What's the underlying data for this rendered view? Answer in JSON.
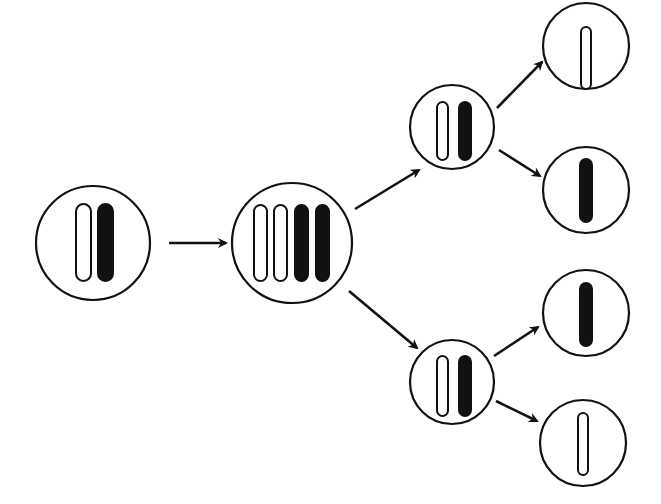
{
  "diagram": {
    "title": "",
    "colors": {
      "stroke": "#111111",
      "fill_dark": "#111111",
      "fill_light": "#ffffff",
      "background": "#ffffff"
    },
    "cells": [
      {
        "id": "parent-cell",
        "cx": 93,
        "cy": 243,
        "r": 57,
        "chromosomes": [
          "open",
          "filled"
        ]
      },
      {
        "id": "replicated-cell",
        "cx": 292,
        "cy": 243,
        "r": 60,
        "chromosomes": [
          "open",
          "open",
          "filled",
          "filled"
        ]
      },
      {
        "id": "daughter-cell-top",
        "cx": 452,
        "cy": 127,
        "r": 42,
        "chromosomes": [
          "open",
          "filled"
        ]
      },
      {
        "id": "daughter-cell-bottom",
        "cx": 452,
        "cy": 382,
        "r": 42,
        "chromosomes": [
          "open",
          "filled"
        ]
      },
      {
        "id": "gamete-1",
        "cx": 586,
        "cy": 46,
        "r": 43,
        "chromosomes": [
          "open"
        ]
      },
      {
        "id": "gamete-2",
        "cx": 586,
        "cy": 190,
        "r": 43,
        "chromosomes": [
          "filled"
        ]
      },
      {
        "id": "gamete-3",
        "cx": 586,
        "cy": 313,
        "r": 43,
        "chromosomes": [
          "filled"
        ]
      },
      {
        "id": "gamete-4",
        "cx": 583,
        "cy": 443,
        "r": 43,
        "chromosomes": [
          "open"
        ]
      }
    ],
    "arrows": [
      {
        "id": "arrow-parent-to-replicated",
        "from": "parent-cell",
        "to": "replicated-cell"
      },
      {
        "id": "arrow-replicated-to-top",
        "from": "replicated-cell",
        "to": "daughter-cell-top"
      },
      {
        "id": "arrow-replicated-to-bottom",
        "from": "replicated-cell",
        "to": "daughter-cell-bottom"
      },
      {
        "id": "arrow-top-to-gamete-1",
        "from": "daughter-cell-top",
        "to": "gamete-1"
      },
      {
        "id": "arrow-top-to-gamete-2",
        "from": "daughter-cell-top",
        "to": "gamete-2"
      },
      {
        "id": "arrow-bottom-to-gamete-3",
        "from": "daughter-cell-bottom",
        "to": "gamete-3"
      },
      {
        "id": "arrow-bottom-to-gamete-4",
        "from": "daughter-cell-bottom",
        "to": "gamete-4"
      }
    ]
  }
}
